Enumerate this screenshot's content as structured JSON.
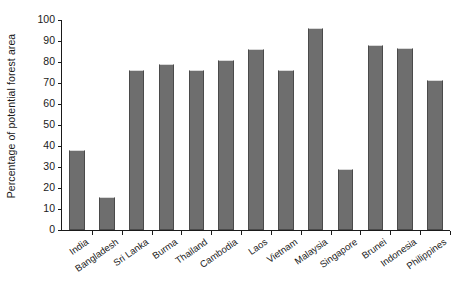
{
  "chart_data": {
    "type": "bar",
    "title": "",
    "xlabel": "",
    "ylabel": "Percentage of potential forest area",
    "ylim": [
      0,
      100
    ],
    "yticks": [
      0,
      10,
      20,
      30,
      40,
      50,
      60,
      70,
      80,
      90,
      100
    ],
    "grid": false,
    "legend": null,
    "bar_color": "#6e6e6e",
    "bar_edge_color": "#4a4a4a",
    "axis_color": "#1a1a1a",
    "categories": [
      "India",
      "Bangladesh",
      "Sri Lanka",
      "Burma",
      "Thailand",
      "Cambodia",
      "Laos",
      "Vietnam",
      "Malaysia",
      "Singapore",
      "Brunei",
      "Indonesia",
      "Philippines"
    ],
    "values": [
      38,
      15.5,
      76,
      79,
      76,
      81,
      86,
      76,
      96,
      29,
      88,
      86.5,
      71.5
    ]
  }
}
